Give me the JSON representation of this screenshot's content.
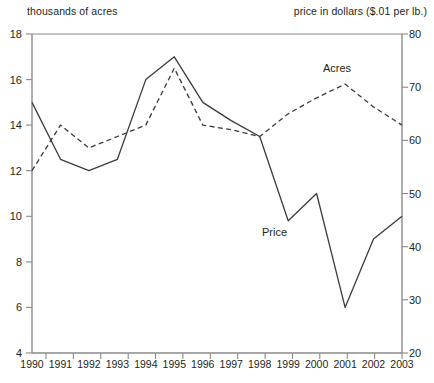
{
  "captions": {
    "left": "thousands of acres",
    "right": "price in dollars ($.01 per lb.)"
  },
  "axes": {
    "left_ticks": [
      "18",
      "16",
      "14",
      "12",
      "10",
      "8",
      "6",
      "4"
    ],
    "right_ticks": [
      "80",
      "70",
      "60",
      "50",
      "40",
      "30",
      "20"
    ],
    "x_ticks": [
      "1990",
      "1991",
      "1992",
      "1993",
      "1994",
      "1995",
      "1996",
      "1997",
      "1998",
      "1999",
      "2000",
      "2001",
      "2002",
      "2003"
    ]
  },
  "series_labels": {
    "acres": "Acres",
    "price": "Price"
  },
  "colors": {
    "axis": "#8a8a8a",
    "line": "#3b3b3b",
    "text": "#231f20"
  },
  "chart_data": {
    "type": "line",
    "title": "",
    "xlabel": "",
    "ylabel": "thousands of acres",
    "y2label": "price in dollars ($.01 per lb.)",
    "x": [
      1990,
      1991,
      1992,
      1993,
      1994,
      1995,
      1996,
      1997,
      1998,
      1999,
      2000,
      2001,
      2002,
      2003
    ],
    "ylim": [
      4,
      18
    ],
    "ytick_step": 2,
    "y2lim": [
      20,
      80
    ],
    "y2tick_step": 10,
    "grid": false,
    "legend": "inline-annotations",
    "series": [
      {
        "name": "Acres",
        "axis": "left",
        "units": "thousands of acres",
        "style": "dashed",
        "values": [
          12.0,
          14.0,
          13.0,
          13.5,
          14.0,
          16.5,
          14.0,
          13.8,
          13.5,
          14.5,
          15.2,
          15.8,
          14.8,
          14.0
        ]
      },
      {
        "name": "Price",
        "axis": "right",
        "units": "$.01 per lb.",
        "style": "solid",
        "values_left_scale": [
          15.0,
          12.5,
          12.0,
          12.5,
          16.0,
          17.0,
          15.0,
          14.2,
          13.5,
          9.8,
          11.0,
          6.0,
          9.0,
          10.0
        ],
        "values": [
          67,
          56,
          54,
          56,
          71,
          76,
          67,
          64,
          61,
          45,
          50,
          29,
          41,
          46
        ]
      }
    ]
  }
}
